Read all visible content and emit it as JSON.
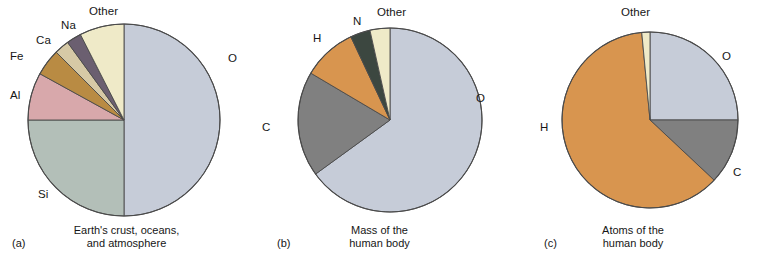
{
  "figure": {
    "background": "#ffffff",
    "outline_color": "#4a4a4a"
  },
  "palette": {
    "oxygen": "#c6ccd8",
    "silicon": "#b3bfb8",
    "aluminum": "#d8a8ab",
    "iron": "#b98b43",
    "calcium": "#d6c9a6",
    "sodium": "#6b5f70",
    "other_cream": "#efeac8",
    "carbon": "#808080",
    "hydrogen": "#d8954f",
    "nitrogen": "#3c4740"
  },
  "panels": [
    {
      "tag": "(a)",
      "caption_lines": [
        "Earth's crust, oceans,",
        "and atmosphere"
      ],
      "labels": [
        {
          "text": "O",
          "left": 228,
          "top": 53
        },
        {
          "text": "Si",
          "left": 38,
          "top": 189
        },
        {
          "text": "Al",
          "left": 10,
          "top": 90
        },
        {
          "text": "Fe",
          "left": 10,
          "top": 51
        },
        {
          "text": "Ca",
          "left": 36,
          "top": 35
        },
        {
          "text": "Na",
          "left": 61,
          "top": 20
        },
        {
          "text": "Other",
          "left": 89,
          "top": 6
        }
      ]
    },
    {
      "tag": "(b)",
      "caption_lines": [
        "Mass of the",
        "human body"
      ],
      "labels": [
        {
          "text": "O",
          "left": 223,
          "top": 93
        },
        {
          "text": "C",
          "left": 9,
          "top": 122
        },
        {
          "text": "H",
          "left": 60,
          "top": 33
        },
        {
          "text": "N",
          "left": 100,
          "top": 16
        },
        {
          "text": "Other",
          "left": 124,
          "top": 7
        }
      ]
    },
    {
      "tag": "(c)",
      "caption_lines": [
        "Atoms of the",
        "human body"
      ],
      "labels": [
        {
          "text": "O",
          "left": 216,
          "top": 51
        },
        {
          "text": "C",
          "left": 227,
          "top": 167
        },
        {
          "text": "H",
          "left": 34,
          "top": 122
        },
        {
          "text": "Other",
          "left": 115,
          "top": 7
        }
      ]
    }
  ],
  "chart_data": [
    {
      "type": "pie",
      "title": "Earth's crust, oceans, and atmosphere",
      "tag": "(a)",
      "categories": [
        "O",
        "Si",
        "Al",
        "Fe",
        "Ca",
        "Na",
        "Other"
      ],
      "values": [
        50,
        25,
        8,
        4.5,
        2.5,
        2.5,
        7.5
      ],
      "unit": "percent by mass",
      "colors": [
        "#c6ccd8",
        "#b3bfb8",
        "#d8a8ab",
        "#b98b43",
        "#d6c9a6",
        "#6b5f70",
        "#efeac8"
      ],
      "start_angle_deg": 0,
      "direction": "clockwise",
      "legend": "labels around slices",
      "center": {
        "x": 124,
        "y": 120
      },
      "radius": 96
    },
    {
      "type": "pie",
      "title": "Mass of the human body",
      "tag": "(b)",
      "categories": [
        "O",
        "C",
        "H",
        "N",
        "Other"
      ],
      "values": [
        65,
        18.5,
        9.5,
        3.5,
        3.5
      ],
      "unit": "percent by mass",
      "colors": [
        "#c6ccd8",
        "#808080",
        "#d8954f",
        "#3c4740",
        "#efeac8"
      ],
      "start_angle_deg": 0,
      "direction": "clockwise",
      "legend": "labels around slices",
      "center": {
        "x": 137,
        "y": 120
      },
      "radius": 92
    },
    {
      "type": "pie",
      "title": "Atoms of the human body",
      "tag": "(c)",
      "categories": [
        "O",
        "C",
        "H",
        "Other"
      ],
      "values": [
        25,
        12,
        61.5,
        1.5
      ],
      "unit": "percent of atoms",
      "colors": [
        "#c6ccd8",
        "#808080",
        "#d8954f",
        "#efeac8"
      ],
      "start_angle_deg": 0,
      "direction": "clockwise",
      "legend": "labels around slices",
      "center": {
        "x": 144,
        "y": 120
      },
      "radius": 88
    }
  ]
}
